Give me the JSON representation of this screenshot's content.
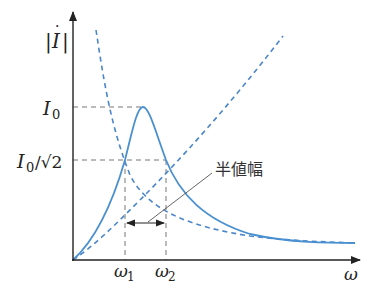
{
  "diagram": {
    "type": "resonance_curve",
    "y_axis_label": "|İ|",
    "x_axis_label": "ω",
    "y_ticks": [
      {
        "label_main": "I",
        "label_sub": "0",
        "label_suffix": "",
        "level": "peak"
      },
      {
        "label_main": "I",
        "label_sub": "0",
        "label_suffix": "/√2",
        "level": "half_power"
      }
    ],
    "x_ticks": [
      {
        "label_main": "ω",
        "label_sub": "1"
      },
      {
        "label_main": "ω",
        "label_sub": "2"
      }
    ],
    "annotation": "半値幅",
    "colors": {
      "curve": "#4a90d0",
      "dashed_curve": "#4a86c8",
      "axis": "#333333",
      "guide": "#777777"
    }
  }
}
